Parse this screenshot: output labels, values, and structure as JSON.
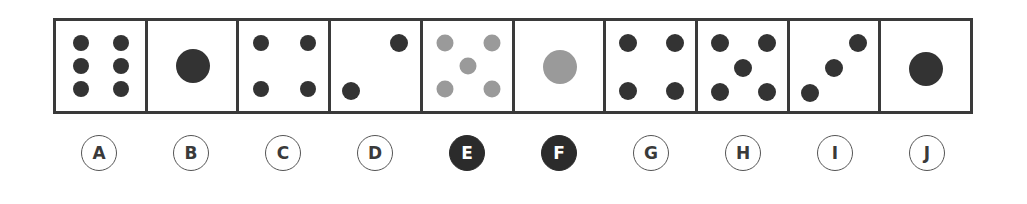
{
  "colors": {
    "dark": "#333333",
    "gray": "#9a9a9a",
    "border": "#3a3a3a"
  },
  "options": [
    {
      "label": "A",
      "selected": false,
      "dots": [
        [
          25,
          22,
          "d",
          16
        ],
        [
          65,
          22,
          "d",
          16
        ],
        [
          25,
          45,
          "d",
          16
        ],
        [
          65,
          45,
          "d",
          16
        ],
        [
          25,
          68,
          "d",
          16
        ],
        [
          65,
          68,
          "d",
          16
        ]
      ]
    },
    {
      "label": "B",
      "selected": false,
      "dots": [
        [
          45,
          45,
          "d",
          34
        ]
      ]
    },
    {
      "label": "C",
      "selected": false,
      "dots": [
        [
          22,
          22,
          "d",
          16
        ],
        [
          69,
          22,
          "d",
          16
        ],
        [
          22,
          68,
          "d",
          16
        ],
        [
          69,
          68,
          "d",
          16
        ]
      ]
    },
    {
      "label": "D",
      "selected": false,
      "dots": [
        [
          68,
          22,
          "d",
          18
        ],
        [
          20,
          70,
          "d",
          18
        ]
      ]
    },
    {
      "label": "E",
      "selected": true,
      "dots": [
        [
          22,
          22,
          "g",
          17
        ],
        [
          69,
          22,
          "g",
          17
        ],
        [
          45,
          45,
          "g",
          17
        ],
        [
          22,
          68,
          "g",
          17
        ],
        [
          69,
          68,
          "g",
          17
        ]
      ]
    },
    {
      "label": "F",
      "selected": true,
      "dots": [
        [
          45,
          46,
          "g",
          34
        ]
      ]
    },
    {
      "label": "G",
      "selected": false,
      "dots": [
        [
          22,
          22,
          "d",
          18
        ],
        [
          69,
          22,
          "d",
          18
        ],
        [
          22,
          70,
          "d",
          18
        ],
        [
          69,
          70,
          "d",
          18
        ]
      ]
    },
    {
      "label": "H",
      "selected": false,
      "dots": [
        [
          22,
          22,
          "d",
          18
        ],
        [
          69,
          22,
          "d",
          18
        ],
        [
          45,
          47,
          "d",
          18
        ],
        [
          22,
          71,
          "d",
          18
        ],
        [
          69,
          71,
          "d",
          18
        ]
      ]
    },
    {
      "label": "I",
      "selected": false,
      "dots": [
        [
          68,
          22,
          "d",
          18
        ],
        [
          44,
          47,
          "d",
          18
        ],
        [
          20,
          72,
          "d",
          18
        ]
      ]
    },
    {
      "label": "J",
      "selected": false,
      "dots": [
        [
          45,
          48,
          "d",
          34
        ]
      ]
    }
  ]
}
